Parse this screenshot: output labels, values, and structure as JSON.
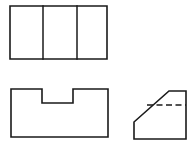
{
  "sheet": {
    "width": 196,
    "height": 152,
    "background": "#ffffff",
    "title": "Orthographic Projection — Three Views",
    "line_color": "#1a1a1a"
  },
  "views": [
    {
      "id": "top-view",
      "name": "Top View",
      "shape": "rectangle-with-two-dividers",
      "outline": "10,6 107,6 107,59 10,59",
      "bounds": {
        "x": 10,
        "y": 6,
        "width": 97,
        "height": 53
      },
      "dividers": [
        {
          "id": "divider-left",
          "x1": 43,
          "y1": 6,
          "x2": 43,
          "y2": 59
        },
        {
          "id": "divider-right",
          "x1": 77,
          "y1": 6,
          "x2": 77,
          "y2": 59
        }
      ]
    },
    {
      "id": "front-view",
      "name": "Front View",
      "shape": "rectangle-with-top-center-notch",
      "outline": "11,89 42,89 42,103 73,103 73,89 108,89 108,137 11,137",
      "bounds": {
        "x": 11,
        "y": 89,
        "width": 97,
        "height": 48
      },
      "notch": {
        "left": 42,
        "right": 73,
        "top": 89,
        "bottom": 103,
        "width": 31,
        "depth": 14
      }
    },
    {
      "id": "side-view",
      "name": "Right Side View",
      "shape": "chamfered-polygon",
      "outline": "134,122 169,91 186,91 186,139 134,139",
      "bounds": {
        "x": 134,
        "y": 91,
        "width": 52,
        "height": 48
      },
      "chamfer": {
        "x1": 134,
        "y1": 122,
        "x2": 169,
        "y2": 91
      },
      "hidden_lines": [
        {
          "id": "hidden-line-1",
          "x1": 147,
          "y1": 105,
          "x2": 186,
          "y2": 105,
          "style": "dashed"
        }
      ]
    }
  ],
  "line_styles": {
    "visible": "solid",
    "hidden": "dashed"
  }
}
